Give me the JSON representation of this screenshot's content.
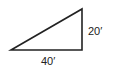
{
  "diagram": {
    "shape": "right-triangle",
    "labels": {
      "vertical_side": "20′",
      "horizontal_side": "40′"
    },
    "stroke_color": "#222222"
  }
}
